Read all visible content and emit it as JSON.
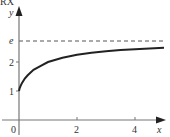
{
  "chart_data": {
    "type": "line",
    "title": "",
    "xlabel": "x",
    "ylabel": "y",
    "xlim": [
      0,
      5.2
    ],
    "ylim": [
      0,
      3.4
    ],
    "grid": false,
    "x_ticks": [
      {
        "value": 0,
        "label": "0"
      },
      {
        "value": 2,
        "label": "2"
      },
      {
        "value": 4,
        "label": "4"
      }
    ],
    "y_ticks": [
      {
        "value": 1,
        "label": "1"
      },
      {
        "value": 2,
        "label": "2"
      },
      {
        "value": 2.718,
        "label": "e"
      }
    ],
    "series": [
      {
        "name": "y = (1 + 1/x)^x",
        "style": "solid",
        "color": "#222222",
        "x": [
          0,
          0.02,
          0.05,
          0.1,
          0.2,
          0.3,
          0.5,
          0.75,
          1,
          1.5,
          2,
          2.5,
          3,
          3.5,
          4,
          4.5,
          5
        ],
        "y": [
          1,
          1.09,
          1.16,
          1.27,
          1.43,
          1.54,
          1.73,
          1.87,
          2.0,
          2.15,
          2.25,
          2.32,
          2.37,
          2.41,
          2.44,
          2.47,
          2.49
        ]
      }
    ],
    "annotations": [
      {
        "type": "hline",
        "y": 2.718,
        "style": "dashed",
        "label": "e",
        "color": "#444444"
      }
    ]
  },
  "labels": {
    "x_axis": "x",
    "y_axis": "y",
    "origin": "0",
    "x_tick_2": "2",
    "x_tick_4": "4",
    "y_tick_1": "1",
    "y_tick_2": "2",
    "y_tick_e": "e",
    "corner_fragment": "RX"
  }
}
